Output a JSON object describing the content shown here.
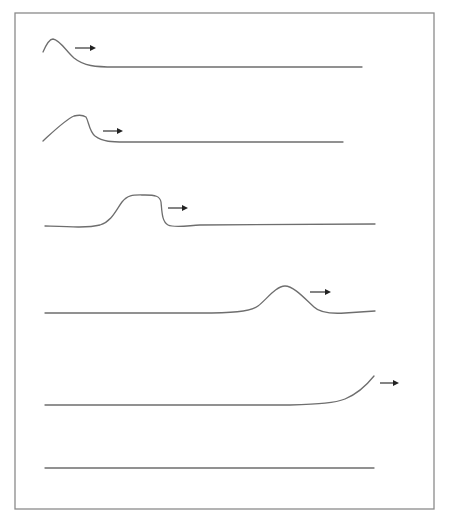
{
  "diagram": {
    "frame": {
      "x": 15,
      "y": 13,
      "width": 419,
      "height": 496,
      "stroke": "#8a8a8a"
    },
    "line_color": "#6e6e6e",
    "arrow_color": "#222222",
    "panels": [
      {
        "id": 1,
        "shape": "pulse near left edge",
        "path": "M43,52 C46,45 49,39 53,39 C60,40 66,51 74,58 C84,66 95,67 115,67 L362,67",
        "arrow": {
          "x1": 75,
          "y1": 48,
          "x2": 96,
          "y2": 48,
          "direction": "right"
        }
      },
      {
        "id": 2,
        "shape": "flattened pulse with steep front",
        "path": "M43,141 C55,130 65,120 74,116 C78,115 83,115 86,117 C89,122 89,131 95,136 C103,142 112,142 125,142 L343,142",
        "arrow": {
          "x1": 103,
          "y1": 131,
          "x2": 123,
          "y2": 131,
          "direction": "right"
        }
      },
      {
        "id": 3,
        "shape": "plateau pulse in middle-left",
        "path": "M45,226 C70,227 88,228 100,225 C112,221 116,210 122,202 C128,194 134,195 145,195 C155,195 160,196 161,202 C162,212 162,222 168,225 C174,228 185,226 200,225 L375,224",
        "arrow": {
          "x1": 168,
          "y1": 208,
          "x2": 188,
          "y2": 208,
          "direction": "right"
        }
      },
      {
        "id": 4,
        "shape": "rounded pulse in middle-right",
        "path": "M45,313 L200,313 C230,313 250,312 258,306 C266,300 276,286 285,286 C294,286 306,300 314,307 C320,313 330,314 345,313 L375,311",
        "arrow": {
          "x1": 310,
          "y1": 292,
          "x2": 331,
          "y2": 292,
          "direction": "right"
        }
      },
      {
        "id": 5,
        "shape": "pulse leaving right edge",
        "path": "M45,405 L290,405 C320,404 335,403 345,399 C357,394 366,386 374,376",
        "arrow": {
          "x1": 380,
          "y1": 383,
          "x2": 399,
          "y2": 383,
          "direction": "right"
        }
      },
      {
        "id": 6,
        "shape": "flat line (pulse exited)",
        "path": "M45,468 L374,468",
        "arrow": null
      }
    ]
  }
}
